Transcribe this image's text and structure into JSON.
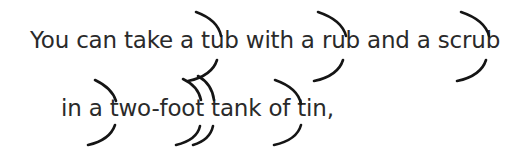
{
  "poem": {
    "lines": [
      "You can take a tub with a rub and a scrub",
      "in a two-foot tank of tin,"
    ]
  },
  "annotations": {
    "type": "rhythm-arc-marks",
    "color": "#151515",
    "arcs": [
      {
        "line": 1,
        "word": "tub"
      },
      {
        "line": 1,
        "word": "rub"
      },
      {
        "line": 1,
        "word": "scrub"
      },
      {
        "line": 2,
        "word": "two"
      },
      {
        "line": 2,
        "word": "foot",
        "count": 2
      },
      {
        "line": 2,
        "word": "tin"
      }
    ]
  }
}
